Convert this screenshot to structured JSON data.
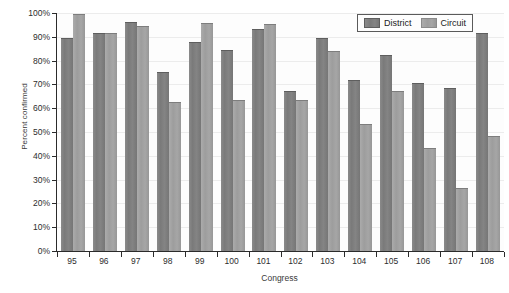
{
  "chart_data": {
    "type": "bar",
    "title": "",
    "xlabel": "Congress",
    "ylabel": "Percent confirmed",
    "categories": [
      "95",
      "96",
      "97",
      "98",
      "99",
      "100",
      "101",
      "102",
      "103",
      "104",
      "105",
      "106",
      "107",
      "108"
    ],
    "series": [
      {
        "name": "District",
        "color": "#7c7c7c",
        "values": [
          89,
          91,
          96,
          75,
          87.5,
          84,
          93,
          67,
          89,
          71.5,
          82,
          70,
          68,
          91
        ]
      },
      {
        "name": "Circuit",
        "color": "#a0a0a0",
        "values": [
          99,
          91,
          94,
          62,
          95.5,
          63,
          95,
          63,
          83.5,
          53,
          67,
          43,
          26,
          48
        ]
      }
    ],
    "ylim": [
      0,
      100
    ],
    "ytick_labels": [
      "0%",
      "10%",
      "20%",
      "30%",
      "40%",
      "50%",
      "60%",
      "70%",
      "80%",
      "90%",
      "100%"
    ],
    "ytick_values": [
      0,
      10,
      20,
      30,
      40,
      50,
      60,
      70,
      80,
      90,
      100
    ],
    "grid": true,
    "legend_position": "top-right"
  }
}
